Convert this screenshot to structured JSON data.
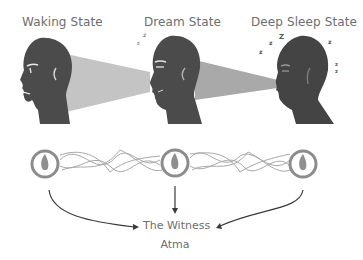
{
  "states": [
    {
      "label": "Waking State",
      "icon": "awake-head"
    },
    {
      "label": "Dream State",
      "icon": "dreaming-head"
    },
    {
      "label": "Deep Sleep State",
      "icon": "sleeping-head"
    }
  ],
  "sleep_marks": {
    "dream": "z z",
    "deep_sleep": "z z Z z z z"
  },
  "witness": {
    "title": "The Witness",
    "subtitle": "Atma"
  },
  "colors": {
    "head": "#4b4b4b",
    "beam": "#bdbdbd",
    "ring": "#8c8c8c",
    "flame": "#8f8f8f",
    "thread": "#a8a8a8",
    "arrow": "#3a3a3a",
    "text": "#6e6e6e"
  }
}
